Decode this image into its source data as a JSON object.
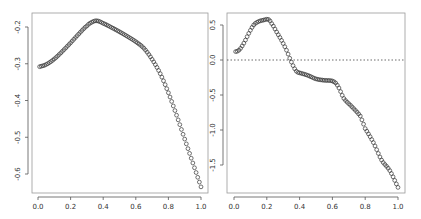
{
  "chart_data": [
    {
      "type": "scatter",
      "title": "",
      "xlabel": "",
      "ylabel": "",
      "xlim": [
        0.0,
        1.0
      ],
      "ylim": [
        -0.64,
        -0.18
      ],
      "xticks": [
        "0.0",
        "0.2",
        "0.4",
        "0.6",
        "0.8",
        "1.0"
      ],
      "yticks": [
        "-0.2",
        "-0.3",
        "-0.4",
        "-0.5",
        "-0.6"
      ],
      "grid": false,
      "marker": "open-circle",
      "x": [
        0.01,
        0.05,
        0.1,
        0.15,
        0.2,
        0.25,
        0.3,
        0.33,
        0.36,
        0.4,
        0.45,
        0.5,
        0.55,
        0.6,
        0.65,
        0.7,
        0.75,
        0.8,
        0.85,
        0.9,
        0.95,
        1.0
      ],
      "values": [
        -0.308,
        -0.302,
        -0.287,
        -0.266,
        -0.243,
        -0.219,
        -0.197,
        -0.187,
        -0.183,
        -0.19,
        -0.201,
        -0.213,
        -0.226,
        -0.24,
        -0.258,
        -0.288,
        -0.327,
        -0.379,
        -0.44,
        -0.505,
        -0.57,
        -0.635
      ]
    },
    {
      "type": "scatter",
      "title": "",
      "xlabel": "",
      "ylabel": "",
      "xlim": [
        0.0,
        1.0
      ],
      "ylim": [
        -1.82,
        0.62
      ],
      "xticks": [
        "0.0",
        "0.2",
        "0.4",
        "0.6",
        "0.8",
        "1.0"
      ],
      "yticks": [
        "0.5",
        "0.0",
        "-0.5",
        "-1.0",
        "-1.5"
      ],
      "grid": false,
      "marker": "open-circle",
      "reference_line": {
        "y": 0.0,
        "style": "dotted"
      },
      "x": [
        0.01,
        0.03,
        0.06,
        0.09,
        0.12,
        0.15,
        0.18,
        0.21,
        0.23,
        0.26,
        0.29,
        0.32,
        0.35,
        0.38,
        0.41,
        0.45,
        0.5,
        0.55,
        0.6,
        0.63,
        0.67,
        0.72,
        0.77,
        0.8,
        0.85,
        0.9,
        0.95,
        1.0
      ],
      "values": [
        0.12,
        0.14,
        0.24,
        0.38,
        0.5,
        0.55,
        0.57,
        0.58,
        0.52,
        0.4,
        0.28,
        0.14,
        -0.03,
        -0.16,
        -0.19,
        -0.22,
        -0.27,
        -0.29,
        -0.3,
        -0.36,
        -0.55,
        -0.67,
        -0.8,
        -0.98,
        -1.18,
        -1.43,
        -1.58,
        -1.82
      ]
    }
  ]
}
